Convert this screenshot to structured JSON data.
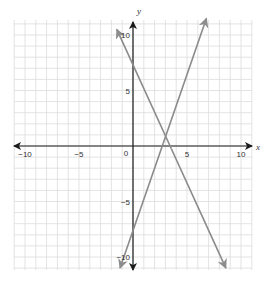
{
  "chart_data": {
    "type": "line",
    "title": "",
    "xlabel": "x",
    "ylabel": "y",
    "xlim": [
      -10,
      10
    ],
    "ylim": [
      -10,
      10
    ],
    "grid": true,
    "grid_step": 1,
    "x_ticks": [
      {
        "value": -10,
        "label": "−10"
      },
      {
        "value": -5,
        "label": "−5"
      },
      {
        "value": 0,
        "label": "0"
      },
      {
        "value": 5,
        "label": "5"
      },
      {
        "value": 10,
        "label": "10"
      }
    ],
    "y_ticks": [
      {
        "value": 10,
        "label": "10"
      },
      {
        "value": 5,
        "label": "5"
      },
      {
        "value": -5,
        "label": "−5"
      },
      {
        "value": -10,
        "label": "−10"
      }
    ],
    "series": [
      {
        "name": "decreasing line",
        "equation": "y = -2x + 7",
        "y_intercept": 7,
        "x_intercept": 3.5,
        "points": [
          [
            -1.5,
            10.5
          ],
          [
            8.6,
            -11
          ]
        ],
        "color": "#8a8a8a"
      },
      {
        "name": "increasing line",
        "equation": "y ≈ 2.8x - 7",
        "y_intercept": -7,
        "x_intercept": 2.5,
        "points": [
          [
            -1.2,
            -11
          ],
          [
            6.8,
            11.5
          ]
        ],
        "color": "#8a8a8a"
      }
    ],
    "intersection": [
      3,
      1.3
    ]
  },
  "colors": {
    "axis": "#1a1a1a",
    "grid": "#dcdcdc",
    "line": "#8c8c8c"
  }
}
